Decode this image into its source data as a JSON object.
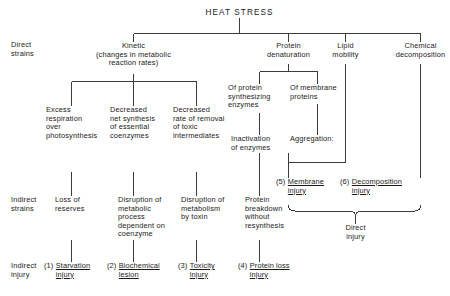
{
  "diagram": {
    "title": "HEAT STRESS",
    "row_labels": [
      {
        "key": "direct_strains",
        "text": "Direct\nstrains"
      },
      {
        "key": "indirect_strains",
        "text": "Indirect\nstrains"
      },
      {
        "key": "indirect_injury",
        "text": "Indirect\ninjury"
      }
    ],
    "direct_strains": [
      {
        "key": "kinetic",
        "text": "Kinetic\n(changes in metabolic\nreaction rates)"
      },
      {
        "key": "protein_denaturation",
        "text": "Protein\ndenaturation"
      },
      {
        "key": "lipid_mobility",
        "text": "Lipid\nmobility"
      },
      {
        "key": "chemical_decomposition",
        "text": "Chemical\ndecomposition"
      }
    ],
    "protein_subtypes": [
      {
        "key": "of_protein_synthesizing_enzymes",
        "text": "Of protein\nsynthesizing\nenzymes"
      },
      {
        "key": "of_membrane_proteins",
        "text": "Of membrane\nproteins"
      }
    ],
    "kinetic_effects": [
      {
        "key": "excess_respiration",
        "text": "Excess\nrespiration\nover\nphotosynthesis"
      },
      {
        "key": "decreased_net_synthesis",
        "text": "Decreased\nnet synthesis\nof essential\ncoenzymes"
      },
      {
        "key": "decreased_rate_removal",
        "text": "Decreased\nrate of removal\nof toxic\nintermediates"
      }
    ],
    "protein_effects": [
      {
        "key": "inactivation_of_enzymes",
        "text": "Inactivation\nof enzymes"
      },
      {
        "key": "aggregation",
        "text": "Aggregation:"
      }
    ],
    "indirect_strains_row": [
      {
        "key": "loss_of_reserves",
        "text": "Loss of\nreserves"
      },
      {
        "key": "disruption_metabolic_process",
        "text": "Disruption of\nmetabolic\nprocess\ndependent on\ncoenzyme"
      },
      {
        "key": "disruption_metabolism_toxin",
        "text": "Disruption of\nmetabolism\nby toxin"
      },
      {
        "key": "protein_breakdown",
        "text": "Protein\nbreakdown\nwithout\nresynthesis"
      }
    ],
    "injuries": [
      {
        "key": "starvation_injury",
        "number": "(1)",
        "text": "Starvation\ninjury"
      },
      {
        "key": "biochemical_lesion",
        "number": "(2)",
        "text": "Biochemical\nlesion"
      },
      {
        "key": "toxicity_injury",
        "number": "(3)",
        "text": "Toxicity\ninjury"
      },
      {
        "key": "protein_loss_injury",
        "number": "(4)",
        "text": "Protein loss\ninjury"
      },
      {
        "key": "membrane_injury",
        "number": "(5)",
        "text": "Membrane\ninjury"
      },
      {
        "key": "decomposition_injury",
        "number": "(6)",
        "text": "Decomposition\ninjury"
      }
    ],
    "direct_injury_label": "Direct\ninjury",
    "colors": {
      "line": "#3c3c3c",
      "text": "#1a1a1a",
      "background": "#ffffff"
    }
  }
}
